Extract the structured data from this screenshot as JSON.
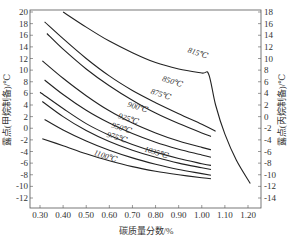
{
  "chart_data": {
    "type": "line",
    "title": "",
    "xlabel": "碳质量分数/%",
    "ylabel_left": "露点(甲烷制备)/℃",
    "ylabel_right": "露点(丙烷制备)/℃",
    "xlim": [
      0.25,
      1.25
    ],
    "ylim_left": [
      -14,
      20
    ],
    "ylim_right": [
      -16,
      18
    ],
    "x_ticks": [
      "0.30",
      "0.40",
      "0.50",
      "0.60",
      "0.70",
      "0.80",
      "0.90",
      "1.00",
      "1.10",
      "1.20"
    ],
    "y_ticks_left": [
      "20",
      "18",
      "16",
      "14",
      "12",
      "10",
      "8",
      "6",
      "4",
      "2",
      "0",
      "-2",
      "-4",
      "-6",
      "-8",
      "-10",
      "-12"
    ],
    "y_ticks_right": [
      "18",
      "16",
      "14",
      "12",
      "10",
      "8",
      "6",
      "4",
      "2",
      "0",
      "-2",
      "-4",
      "-6",
      "-8",
      "-10",
      "-12",
      "-14"
    ],
    "grid": false,
    "series": [
      {
        "name": "815℃",
        "x": [
          0.4,
          0.5,
          0.6,
          0.7,
          0.8,
          0.9,
          1.0,
          1.03,
          1.06,
          1.1,
          1.15,
          1.21
        ],
        "y": [
          20,
          17.4,
          15.0,
          13.0,
          11.3,
          10.2,
          9.5,
          9.3,
          4.0,
          -1.0,
          -5.5,
          -9.5
        ]
      },
      {
        "name": "850℃",
        "x": [
          0.32,
          0.4,
          0.5,
          0.6,
          0.7,
          0.8,
          0.9,
          1.0,
          1.06
        ],
        "y": [
          18.3,
          15.4,
          12.0,
          9.0,
          6.5,
          4.4,
          2.5,
          0.7,
          -0.5
        ]
      },
      {
        "name": "875℃",
        "x": [
          0.33,
          0.4,
          0.5,
          0.6,
          0.7,
          0.8,
          0.9,
          1.0,
          1.04
        ],
        "y": [
          16.3,
          13.6,
          10.2,
          7.3,
          4.8,
          2.6,
          0.8,
          -0.8,
          -1.4
        ]
      },
      {
        "name": "900℃",
        "x": [
          0.31,
          0.4,
          0.5,
          0.6,
          0.7,
          0.8,
          0.9,
          1.0,
          1.04
        ],
        "y": [
          11.6,
          8.6,
          5.6,
          3.0,
          0.9,
          -0.8,
          -2.2,
          -3.3,
          -3.7
        ]
      },
      {
        "name": "925℃",
        "x": [
          0.32,
          0.4,
          0.5,
          0.6,
          0.7,
          0.8,
          0.9,
          1.0,
          1.04
        ],
        "y": [
          8.3,
          5.8,
          3.1,
          0.9,
          -0.9,
          -2.4,
          -3.6,
          -4.6,
          -5.0
        ]
      },
      {
        "name": "950℃",
        "x": [
          0.3,
          0.4,
          0.5,
          0.6,
          0.7,
          0.8,
          0.9,
          1.0,
          1.04
        ],
        "y": [
          6.2,
          3.4,
          0.8,
          -1.2,
          -2.8,
          -4.1,
          -5.2,
          -6.1,
          -6.4
        ]
      },
      {
        "name": "975℃",
        "x": [
          0.31,
          0.4,
          0.5,
          0.6,
          0.7,
          0.8,
          0.9,
          1.0,
          1.04
        ],
        "y": [
          4.6,
          2.0,
          -0.4,
          -2.3,
          -3.8,
          -5.0,
          -6.0,
          -6.8,
          -7.1
        ]
      },
      {
        "name": "1035℃",
        "x": [
          0.32,
          0.4,
          0.5,
          0.6,
          0.7,
          0.8,
          0.9,
          1.0,
          1.04
        ],
        "y": [
          1.5,
          -0.3,
          -2.2,
          -3.8,
          -5.1,
          -6.2,
          -7.1,
          -7.8,
          -8.1
        ]
      },
      {
        "name": "1100℃",
        "x": [
          0.31,
          0.4,
          0.5,
          0.6,
          0.7,
          0.8,
          0.9,
          1.0,
          1.04
        ],
        "y": [
          -1.8,
          -3.0,
          -4.4,
          -5.6,
          -6.6,
          -7.4,
          -8.0,
          -8.5,
          -8.7
        ]
      }
    ],
    "annotations": [
      {
        "text": "815℃",
        "x": 0.98,
        "y": 12.5
      },
      {
        "text": "850℃",
        "x": 0.87,
        "y": 7.6
      },
      {
        "text": "875℃",
        "x": 0.82,
        "y": 5.4
      },
      {
        "text": "900℃",
        "x": 0.72,
        "y": 3.2
      },
      {
        "text": "925℃",
        "x": 0.68,
        "y": 1.2
      },
      {
        "text": "950℃",
        "x": 0.65,
        "y": -0.4
      },
      {
        "text": "975℃",
        "x": 0.63,
        "y": -2.0
      },
      {
        "text": "1035℃",
        "x": 0.8,
        "y": -4.6
      },
      {
        "text": "1100℃",
        "x": 0.58,
        "y": -5.2
      }
    ]
  }
}
